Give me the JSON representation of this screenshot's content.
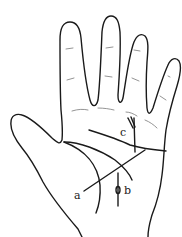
{
  "figure": {
    "labels": {
      "a": "a",
      "b": "b",
      "c": "c"
    },
    "colors": {
      "ink": "#1a1a1a",
      "background": "#ffffff"
    }
  }
}
